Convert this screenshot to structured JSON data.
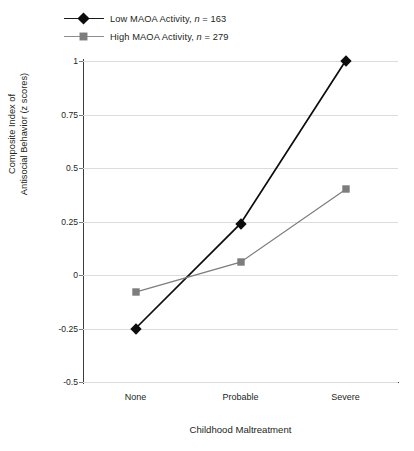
{
  "chart_data": {
    "type": "line",
    "title": "",
    "xlabel": "Childhood Maltreatment",
    "ylabel_line1": "Composite Index of",
    "ylabel_line2": "Antisocial Behavior (z scores)",
    "categories": [
      "None",
      "Probable",
      "Severe"
    ],
    "ylim": [
      -0.5,
      1
    ],
    "yticks": [
      1,
      0.75,
      0.5,
      0.25,
      0,
      -0.25,
      -0.5
    ],
    "ytick_labels": [
      "1",
      "0.75",
      "0.5",
      "0.25",
      "0",
      "-0.25",
      "-0.5"
    ],
    "grid": true,
    "legend_position": "top-left",
    "series": [
      {
        "name": "Low MAOA Activity, n = 163",
        "short_name": "Low MAOA Activity",
        "n": 163,
        "marker": "diamond",
        "color": "#0d0d0d",
        "values": [
          -0.25,
          0.24,
          1.0
        ]
      },
      {
        "name": "High MAOA Activity, n = 279",
        "short_name": "High MAOA Activity",
        "n": 279,
        "marker": "square",
        "color": "#7d7d7d",
        "values": [
          -0.08,
          0.06,
          0.4
        ]
      }
    ]
  },
  "legend": {
    "items": [
      {
        "label_main": "Low MAOA Activity, ",
        "label_italic": "n",
        "label_tail": " = 163"
      },
      {
        "label_main": "High MAOA Activity, ",
        "label_italic": "n",
        "label_tail": " = 279"
      }
    ]
  }
}
